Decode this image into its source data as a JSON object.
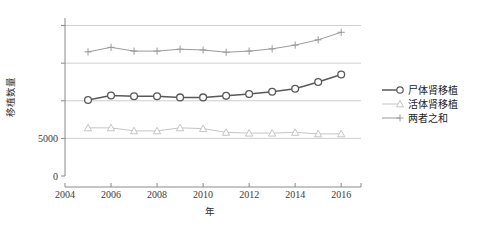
{
  "chart_data": {
    "type": "line",
    "title": "",
    "xlabel": "年",
    "ylabel": "移植数量",
    "x": [
      2005,
      2006,
      2007,
      2008,
      2009,
      2010,
      2011,
      2012,
      2013,
      2014,
      2015,
      2016
    ],
    "xlim": [
      2004,
      2016.6
    ],
    "ylim": [
      0,
      21000
    ],
    "xticks": [
      "2004",
      "2006",
      "2008",
      "2010",
      "2012",
      "2014",
      "2016"
    ],
    "xtick_values": [
      2004,
      2006,
      2008,
      2010,
      2012,
      2014,
      2016
    ],
    "ytick_values": [
      0,
      5000,
      10000,
      15000,
      20000
    ],
    "yticks": [
      "0",
      "5000",
      "",
      "",
      ""
    ],
    "grid": true,
    "legend_position": "right",
    "series": [
      {
        "name": "尸体肾移植",
        "marker": "circle",
        "color": "#595959",
        "values": [
          10100,
          10700,
          10600,
          10600,
          10450,
          10450,
          10650,
          10900,
          11200,
          11600,
          12500,
          13500
        ]
      },
      {
        "name": "活体肾移植",
        "marker": "triangle",
        "color": "#c5c5c5",
        "values": [
          6400,
          6400,
          6000,
          6000,
          6400,
          6300,
          5800,
          5700,
          5700,
          5800,
          5600,
          5600
        ]
      },
      {
        "name": "两者之和",
        "marker": "plus",
        "color": "#9a9a9a",
        "values": [
          16500,
          17100,
          16600,
          16600,
          16850,
          16750,
          16450,
          16600,
          16900,
          17400,
          18100,
          19100
        ]
      }
    ]
  },
  "legend": {
    "items": [
      {
        "label": "尸体肾移植"
      },
      {
        "label": "活体肾移植"
      },
      {
        "label": "两者之和"
      }
    ]
  }
}
